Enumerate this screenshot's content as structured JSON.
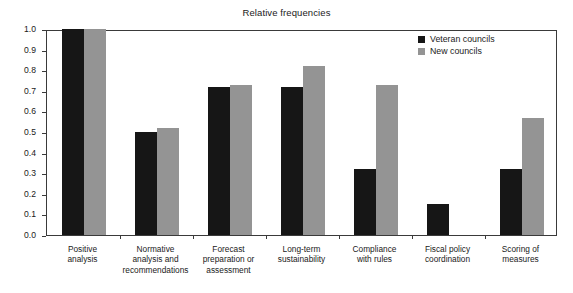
{
  "chart_data": {
    "type": "bar",
    "title": "Relative frequencies",
    "xlabel": "",
    "ylabel": "",
    "ylim": [
      0.0,
      1.0
    ],
    "grid": false,
    "legend_position": "top-right",
    "ytick_labels": [
      "1.0",
      "0.9",
      "0.8",
      "0.7",
      "0.6",
      "0.5",
      "0.4",
      "0.3",
      "0.2",
      "0.1",
      "0.0"
    ],
    "ytick_values": [
      1.0,
      0.9,
      0.8,
      0.7,
      0.6,
      0.5,
      0.4,
      0.3,
      0.2,
      0.1,
      0.0
    ],
    "categories": [
      "Positive analysis",
      "Normative analysis and recommendations",
      "Forecast preparation or assessment",
      "Long-term sustainability",
      "Compliance with rules",
      "Fiscal policy coordination",
      "Scoring of measures"
    ],
    "category_lines": [
      [
        "Positive",
        "analysis"
      ],
      [
        "Normative",
        "analysis and",
        "recommendations"
      ],
      [
        "Forecast",
        "preparation or",
        "assessment"
      ],
      [
        "Long-term",
        "sustainability"
      ],
      [
        "Compliance",
        "with rules"
      ],
      [
        "Fiscal policy",
        "coordination"
      ],
      [
        "Scoring of",
        "measures"
      ]
    ],
    "series": [
      {
        "name": "Veteran councils",
        "color": "#161616",
        "values": [
          1.0,
          0.5,
          0.72,
          0.72,
          0.32,
          0.15,
          0.32
        ]
      },
      {
        "name": "New councils",
        "color": "#949494",
        "values": [
          1.0,
          0.52,
          0.73,
          0.82,
          0.73,
          0.0,
          0.57
        ]
      }
    ]
  },
  "legend": {
    "entries": [
      {
        "label": "Veteran councils",
        "swatch": "veteran"
      },
      {
        "label": "New councils",
        "swatch": "newc"
      }
    ]
  }
}
